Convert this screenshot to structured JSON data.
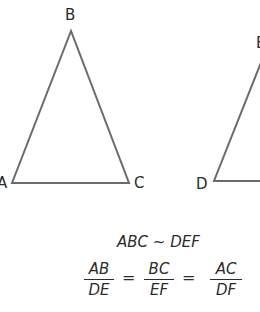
{
  "diagram": {
    "triangle_abc": {
      "vertices": {
        "A": "A",
        "B": "B",
        "C": "C"
      },
      "stroke_color": "#6b6b6b"
    },
    "triangle_def": {
      "vertices": {
        "D": "D",
        "E": "E"
      },
      "stroke_color": "#6b6b6b"
    },
    "similarity_statement": "ABC ~ DEF",
    "ratios": [
      {
        "numerator": "AB",
        "denominator": "DE"
      },
      {
        "numerator": "BC",
        "denominator": "EF"
      },
      {
        "numerator": "AC",
        "denominator": "DF"
      }
    ],
    "equals_sign": "="
  }
}
